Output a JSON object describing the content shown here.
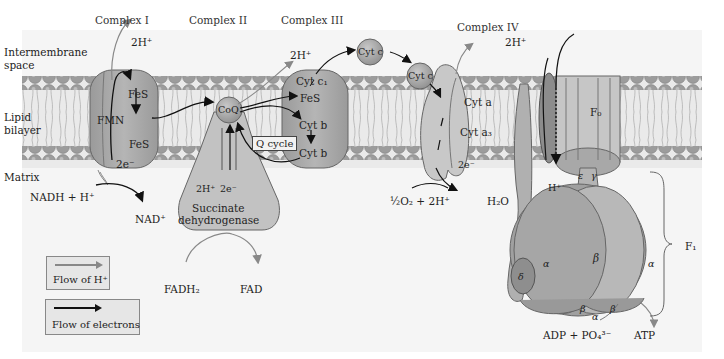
{
  "headers": {
    "complex1": "Complex I",
    "complex2": "Complex II",
    "complex3": "Complex III",
    "complex4": "Complex IV"
  },
  "regions": {
    "intermembrane": "Intermembrane space",
    "intermembrane_l1": "Intermembrane",
    "intermembrane_l2": "space",
    "lipid_l1": "Lipid",
    "lipid_l2": "bilayer",
    "matrix": "Matrix"
  },
  "complex1": {
    "proton_out": "2H⁺",
    "fes_top": "FeS",
    "fmn": "FMN",
    "fes_bottom": "FeS",
    "electrons": "2e⁻",
    "substrate": "NADH + H⁺",
    "product": "NAD⁺"
  },
  "complex2": {
    "coq": "CoQ",
    "protons": "2H⁺",
    "electrons": "2e⁻",
    "name_l1": "Succinate",
    "name_l2": "dehydrogenase",
    "substrate": "FADH₂",
    "product": "FAD"
  },
  "complex3": {
    "proton_out": "2H⁺",
    "cyt_c1": "Cyt c₁",
    "fes": "FeS",
    "cyt_b_top": "Cyt b",
    "cyt_b_bottom": "Cyt b",
    "q_cycle": "Q cycle",
    "cyt_c_mobile": "Cyt c"
  },
  "complex4": {
    "cyt_c": "Cyt c",
    "proton_out": "2H⁺",
    "cyt_a": "Cyt a",
    "cyt_a3": "Cyt a₃",
    "electrons": "2e⁻",
    "substrate": "½O₂ + 2H⁺",
    "product": "H₂O"
  },
  "atp_synthase": {
    "f0": "F₀",
    "f1": "F₁",
    "proton_in": "H⁺",
    "epsilon": "ε",
    "gamma": "γ",
    "delta": "δ",
    "alpha_left": "α",
    "alpha_right": "α",
    "alpha_bottom": "α",
    "beta_center": "β",
    "beta_bottom_left": "β",
    "beta_bottom_right": "β",
    "substrate": "ADP + PO₄³⁻",
    "product": "ATP"
  },
  "legend": {
    "proton_flow": "Flow of H⁺",
    "electron_flow": "Flow of electrons",
    "proton_color": "#8a8a8a",
    "electron_color": "#111111"
  },
  "colors": {
    "protein_fill": "#a8a8a8",
    "protein_light": "#c4c4c4",
    "lipid_head": "#9a9a9a",
    "membrane_bg": "#ececec",
    "panel_bg": "#f4f4f4"
  }
}
